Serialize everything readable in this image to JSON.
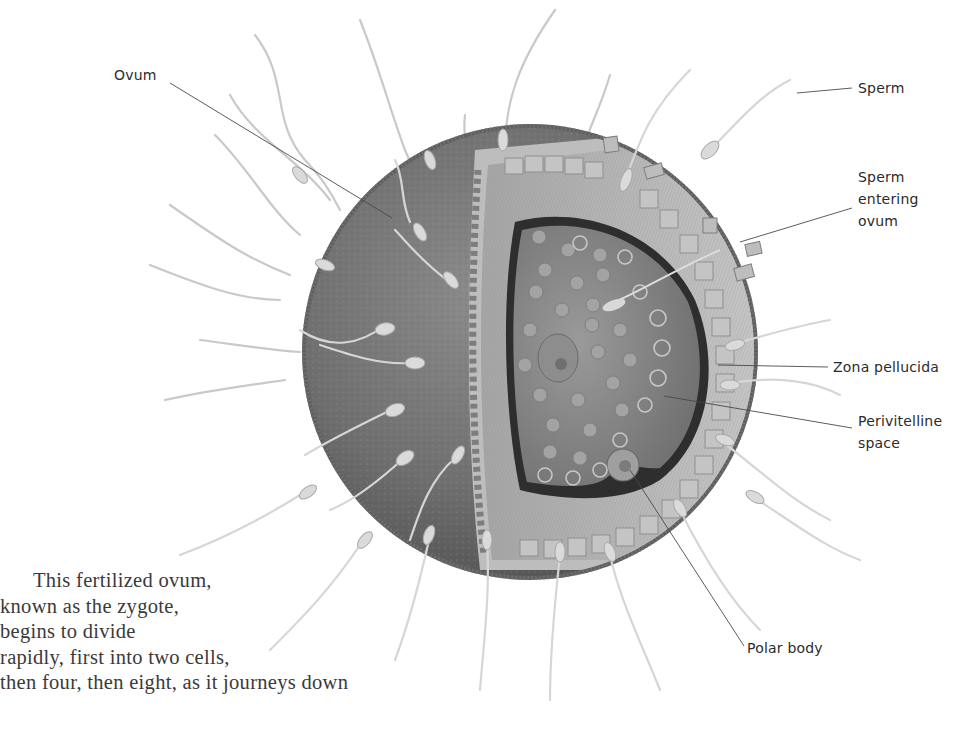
{
  "diagram": {
    "colors": {
      "ovum_surface": "#6e6e6e",
      "cytoplasm": "#8a8a8a",
      "zona": "#b9b9b9",
      "sperm": "#d2d2d2",
      "leader_line": "#444444",
      "text": "#2b2b2b"
    },
    "labels": [
      {
        "id": "ovum",
        "text": "Ovum"
      },
      {
        "id": "sperm",
        "text": "Sperm"
      },
      {
        "id": "sperm-entering",
        "lines": [
          "Sperm",
          "entering",
          "ovum"
        ]
      },
      {
        "id": "zona-pellucida",
        "text": "Zona pellucida"
      },
      {
        "id": "perivitelline",
        "lines": [
          "Perivitelline",
          "space"
        ]
      },
      {
        "id": "polar-body",
        "text": "Polar body"
      }
    ]
  },
  "body_text": {
    "lines": [
      "This fertilized ovum,",
      "known as the zygote,",
      "begins to divide",
      "rapidly, first into two cells,",
      "then four, then eight, as it journeys down"
    ]
  }
}
